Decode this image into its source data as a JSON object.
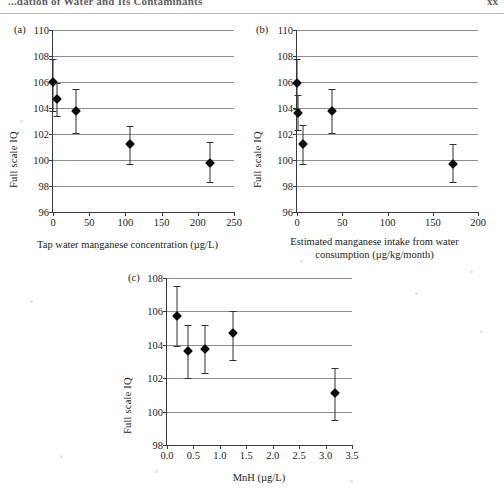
{
  "header": {
    "title": "...dation of Water and Its Contaminants",
    "page_number": "xx"
  },
  "figure": {
    "panels": [
      {
        "tag": "(a)",
        "xlabel": "Tap water manganese concentration (µg/L)",
        "ylabel": "Full scale IQ"
      },
      {
        "tag": "(b)",
        "xlabel": "Estimated manganese intake from water\nconsumption (µg/kg/month)",
        "ylabel": "Full scale IQ"
      },
      {
        "tag": "(c)",
        "xlabel": "MnH (µg/L)",
        "ylabel": "Full scale IQ"
      }
    ]
  },
  "chart_data": [
    {
      "type": "scatter",
      "panel": "(a)",
      "title": "",
      "xlabel": "Tap water manganese concentration (µg/L)",
      "ylabel": "Full scale IQ",
      "xlim": [
        0,
        250
      ],
      "ylim": [
        96,
        110
      ],
      "xticks": [
        0,
        50,
        100,
        150,
        200,
        250
      ],
      "yticks": [
        96,
        98,
        100,
        102,
        104,
        106,
        108,
        110
      ],
      "xticklabels": [
        "0",
        "50",
        "100",
        "150",
        "200",
        "250"
      ],
      "yticklabels": [
        "96",
        "98",
        "100",
        "102",
        "104",
        "106",
        "108",
        "110"
      ],
      "grid": "horizontal",
      "legend": null,
      "x": [
        0,
        5,
        32,
        106,
        217
      ],
      "y": [
        106.0,
        104.7,
        103.8,
        101.2,
        99.8
      ],
      "yerr_low": [
        103.8,
        103.4,
        102.1,
        99.7,
        98.3
      ],
      "yerr_high": [
        107.8,
        105.9,
        105.5,
        102.6,
        101.4
      ]
    },
    {
      "type": "scatter",
      "panel": "(b)",
      "title": "",
      "xlabel": "Estimated manganese intake from water consumption (µg/kg/month)",
      "ylabel": "Full scale IQ",
      "xlim": [
        0,
        200
      ],
      "ylim": [
        96,
        110
      ],
      "xticks": [
        0,
        50,
        100,
        150,
        200
      ],
      "yticks": [
        96,
        98,
        100,
        102,
        104,
        106,
        108,
        110
      ],
      "xticklabels": [
        "0",
        "50",
        "100",
        "150",
        "200"
      ],
      "yticklabels": [
        "96",
        "98",
        "100",
        "102",
        "104",
        "106",
        "108",
        "110"
      ],
      "grid": "horizontal",
      "legend": null,
      "x": [
        0,
        1.5,
        7,
        39,
        172
      ],
      "y": [
        105.9,
        103.6,
        101.2,
        103.8,
        99.7
      ],
      "yerr_low": [
        103.9,
        102.3,
        99.7,
        102.1,
        98.3
      ],
      "yerr_high": [
        107.8,
        105.0,
        102.7,
        105.5,
        101.2
      ]
    },
    {
      "type": "scatter",
      "panel": "(c)",
      "title": "",
      "xlabel": "MnH (µg/L)",
      "ylabel": "Full scale IQ",
      "xlim": [
        0,
        3.5
      ],
      "ylim": [
        98,
        108
      ],
      "xticks": [
        0.0,
        0.5,
        1.0,
        1.5,
        2.0,
        2.5,
        3.0,
        3.5
      ],
      "yticks": [
        98,
        100,
        102,
        104,
        106,
        108
      ],
      "xticklabels": [
        "0.0",
        "0.5",
        "1.0",
        "1.5",
        "2.0",
        "2.5",
        "3.0",
        "3.5"
      ],
      "yticklabels": [
        "98",
        "100",
        "102",
        "104",
        "106",
        "108"
      ],
      "grid": "horizontal",
      "legend": null,
      "x": [
        0.18,
        0.4,
        0.72,
        1.25,
        3.17
      ],
      "y": [
        105.7,
        103.6,
        103.75,
        104.7,
        101.1
      ],
      "yerr_low": [
        103.9,
        102.0,
        102.3,
        103.1,
        99.5
      ],
      "yerr_high": [
        107.5,
        105.2,
        105.2,
        106.0,
        102.6
      ]
    }
  ]
}
